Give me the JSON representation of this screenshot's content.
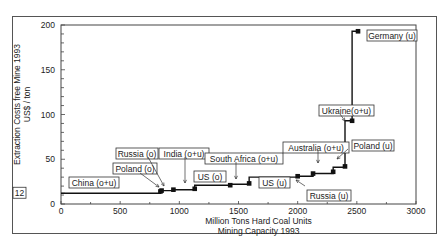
{
  "chart_data": {
    "type": "line",
    "subtype": "step",
    "title": "",
    "xlabel": "Million Tons Hard Coal Units",
    "xlabel2": "Mining Capacity 1993",
    "ylabel": "Extraction Costs free Mine 1993",
    "ylabel2": "US$ / ton",
    "xlim": [
      0,
      3000
    ],
    "ylim": [
      0,
      200
    ],
    "xticks": [
      "0",
      "500",
      "1000",
      "1500",
      "2000",
      "2500",
      "3000"
    ],
    "yticks": [
      "0",
      "50",
      "100",
      "150",
      "200"
    ],
    "reference_label": "12",
    "grid": false,
    "x": [
      0,
      830,
      840,
      850,
      950,
      1130,
      1130,
      1430,
      1590,
      1590,
      2000,
      2130,
      2130,
      2300,
      2300,
      2400,
      2400,
      2460,
      2460,
      2510
    ],
    "y": [
      12,
      12,
      14,
      15,
      16,
      17,
      21,
      22,
      23,
      30,
      31,
      33,
      34,
      36,
      41,
      42,
      93,
      93,
      193,
      193
    ],
    "annotations": [
      {
        "text": "China (o+u)",
        "x": 300,
        "y": 17
      },
      {
        "text": "Poland (o)",
        "x": 840,
        "y": 14
      },
      {
        "text": "Russia (o)",
        "x": 850,
        "y": 15
      },
      {
        "text": "India (o+u)",
        "x": 1050,
        "y": 17
      },
      {
        "text": "US (o)",
        "x": 1280,
        "y": 22
      },
      {
        "text": "South Africa (o+u)",
        "x": 1500,
        "y": 23
      },
      {
        "text": "US (u)",
        "x": 1800,
        "y": 30
      },
      {
        "text": "Australia (o+u)",
        "x": 2200,
        "y": 36
      },
      {
        "text": "Russia (u)",
        "x": 2060,
        "y": 31
      },
      {
        "text": "Poland (u)",
        "x": 2350,
        "y": 41
      },
      {
        "text": "Ukraine(o+u)",
        "x": 2440,
        "y": 93
      },
      {
        "text": "Germany (u)",
        "x": 2510,
        "y": 193
      }
    ]
  }
}
